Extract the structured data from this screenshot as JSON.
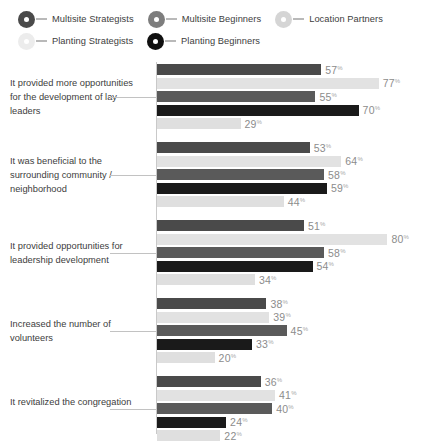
{
  "legend": {
    "rows": [
      [
        {
          "label": "Multisite Strategists",
          "color": "#4a4a4a",
          "marker": "legend-dot-icon"
        },
        {
          "label": "Multisite Beginners",
          "color": "#7d7d7d",
          "marker": "legend-dot-icon"
        },
        {
          "label": "Location Partners",
          "color": "#d5d5d5",
          "marker": "legend-dot-icon"
        }
      ],
      [
        {
          "label": "Planting Strategists",
          "color": "#ececec",
          "marker": "legend-dot-icon"
        },
        {
          "label": "Planting Beginners",
          "color": "#101010",
          "marker": "legend-dot-icon"
        }
      ]
    ]
  },
  "chart_data": {
    "type": "bar",
    "orientation": "horizontal",
    "title": "",
    "xlabel": "",
    "ylabel": "",
    "xlim": [
      0,
      90
    ],
    "grid": false,
    "legend_position": "top",
    "value_suffix": "%",
    "categories": [
      "It provided more opportunities for the development of lay leaders",
      "It was beneficial to the surrounding community / neighborhood",
      "It provided opportunities for leadership development",
      "Increased the number of volunteers",
      "It revitalized the congregation"
    ],
    "series": [
      {
        "name": "Multisite Strategists",
        "color": "#4a4a4a",
        "values": [
          57,
          53,
          51,
          38,
          36
        ]
      },
      {
        "name": "Location Partners",
        "color": "#e2e2e2",
        "values": [
          77,
          64,
          80,
          39,
          41
        ]
      },
      {
        "name": "Multisite Beginners",
        "color": "#5a5a5a",
        "values": [
          55,
          58,
          58,
          45,
          40
        ]
      },
      {
        "name": "Planting Beginners",
        "color": "#1a1a1a",
        "values": [
          70,
          59,
          54,
          33,
          24
        ]
      },
      {
        "name": "Planting Strategists",
        "color": "#dfdfdf",
        "values": [
          29,
          44,
          34,
          20,
          22
        ]
      }
    ]
  }
}
